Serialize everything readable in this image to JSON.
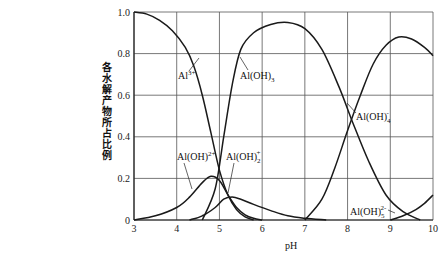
{
  "chart_data": {
    "type": "line",
    "title": "",
    "xlabel": "pH",
    "ylabel": "各水解产物所占比例",
    "xlim": [
      3,
      10
    ],
    "ylim": [
      0,
      1.0
    ],
    "x_ticks": [
      "3",
      "4",
      "5",
      "6",
      "7",
      "8",
      "9",
      "10"
    ],
    "y_ticks": [
      "0",
      "0.2",
      "0.4",
      "0.6",
      "0.8",
      "1.0"
    ],
    "grid": true,
    "legend": "inline labels",
    "series": [
      {
        "name": "Al3+",
        "label_main": "Al",
        "label_sup": "3+",
        "label_sub": "",
        "x": [
          3.0,
          3.3,
          3.6,
          3.9,
          4.2,
          4.4,
          4.6,
          4.8,
          5.0,
          5.2,
          5.4,
          5.6,
          5.8
        ],
        "y": [
          1.0,
          0.99,
          0.96,
          0.91,
          0.83,
          0.74,
          0.6,
          0.42,
          0.24,
          0.12,
          0.05,
          0.015,
          0.0
        ]
      },
      {
        "name": "Al(OH)2+",
        "label_main": "Al(OH)",
        "label_sup": "2+",
        "label_sub": "",
        "x": [
          3.0,
          3.5,
          4.0,
          4.3,
          4.6,
          4.8,
          5.0,
          5.2,
          5.4,
          5.6,
          5.8,
          6.0
        ],
        "y": [
          0.0,
          0.02,
          0.06,
          0.11,
          0.18,
          0.21,
          0.19,
          0.12,
          0.06,
          0.025,
          0.008,
          0.0
        ]
      },
      {
        "name": "Al(OH)2+ (dihydroxo)",
        "label_main": "Al(OH)",
        "label_sup": "+",
        "label_sub": "2",
        "x": [
          4.3,
          4.6,
          4.9,
          5.1,
          5.3,
          5.5,
          5.8,
          6.2,
          6.6,
          7.0,
          7.5
        ],
        "y": [
          0.0,
          0.02,
          0.06,
          0.1,
          0.11,
          0.1,
          0.075,
          0.045,
          0.02,
          0.008,
          0.0
        ]
      },
      {
        "name": "Al(OH)3",
        "label_main": "Al(OH)",
        "label_sup": "",
        "label_sub": "3",
        "x": [
          4.6,
          4.9,
          5.1,
          5.3,
          5.5,
          5.8,
          6.2,
          6.6,
          7.0,
          7.4,
          7.8,
          8.1,
          8.5,
          8.9,
          9.3,
          9.7
        ],
        "y": [
          0.0,
          0.15,
          0.4,
          0.65,
          0.82,
          0.9,
          0.94,
          0.95,
          0.92,
          0.82,
          0.64,
          0.48,
          0.28,
          0.12,
          0.04,
          0.0
        ]
      },
      {
        "name": "Al(OH)4-",
        "label_main": "Al(OH)",
        "label_sup": "-",
        "label_sub": "4",
        "x": [
          7.0,
          7.4,
          7.7,
          8.0,
          8.3,
          8.6,
          8.9,
          9.2,
          9.5,
          9.8,
          10.0
        ],
        "y": [
          0.0,
          0.1,
          0.25,
          0.43,
          0.6,
          0.75,
          0.84,
          0.88,
          0.87,
          0.83,
          0.79
        ]
      },
      {
        "name": "Al(OH)5 2-",
        "label_main": "Al(OH)",
        "label_sup": "2-",
        "label_sub": "5",
        "x": [
          9.0,
          9.3,
          9.6,
          9.8,
          10.0
        ],
        "y": [
          0.0,
          0.02,
          0.05,
          0.08,
          0.12
        ]
      }
    ]
  },
  "labels": {
    "al3": {
      "main": "Al",
      "sup": "3+",
      "sub": ""
    },
    "aloh3": {
      "main": "Al(OH)",
      "sup": "",
      "sub": "3"
    },
    "aloh4": {
      "main": "Al(OH)",
      "sup": "-",
      "sub": "4"
    },
    "aloh2plus": {
      "main": "Al(OH)",
      "sup": "2+",
      "sub": ""
    },
    "aloh2": {
      "main": "Al(OH)",
      "sup": "+",
      "sub": "2"
    },
    "aloh5": {
      "main": "Al(OH)",
      "sup": "2-",
      "sub": "5"
    }
  }
}
